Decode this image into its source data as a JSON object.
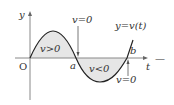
{
  "diagram": {
    "title": "",
    "axes": {
      "y_label": "y",
      "x_label": "t",
      "origin_label": "O"
    },
    "curve_label": "y=v(t)",
    "points": {
      "a_label": "a",
      "b_label": "b"
    },
    "regions": {
      "positive_label": "v>0",
      "negative_label": "v<0"
    },
    "annotations": {
      "v_zero_at_a": "v=0",
      "v_zero_at_b": "v=0"
    },
    "trailing_symbol": "—",
    "colors": {
      "curve": "#222222",
      "axis": "#888888",
      "fill": "#e6e6e6",
      "text": "#333333"
    }
  }
}
